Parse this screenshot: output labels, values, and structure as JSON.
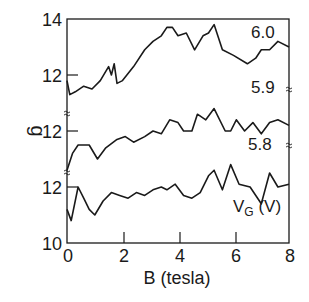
{
  "chart_data": {
    "type": "line",
    "title": "",
    "xlabel": "B (tesla)",
    "ylabel": "g",
    "xlim": [
      0,
      8
    ],
    "ylim": [
      10,
      14
    ],
    "x_ticks": [
      "0",
      "2",
      "4",
      "6",
      "8"
    ],
    "y_ticks": [
      "10",
      "12",
      "12",
      "12",
      "14"
    ],
    "grid": false,
    "legend": {
      "title": "V_G (V)",
      "position": "right, inline labels"
    },
    "series": [
      {
        "name": "6.0",
        "x": [
          0.0,
          0.1,
          0.3,
          0.6,
          0.9,
          1.2,
          1.5,
          1.6,
          1.7,
          1.8,
          2.0,
          2.4,
          2.8,
          3.1,
          3.4,
          3.6,
          3.8,
          4.0,
          4.3,
          4.6,
          4.9,
          5.1,
          5.3,
          5.6,
          6.0,
          6.5,
          6.8,
          7.0,
          7.3,
          7.6,
          8.0
        ],
        "values": [
          11.8,
          11.3,
          11.4,
          11.6,
          11.5,
          11.8,
          12.3,
          12.0,
          12.4,
          11.7,
          11.8,
          12.3,
          12.9,
          13.2,
          13.4,
          13.7,
          13.7,
          13.4,
          13.5,
          12.9,
          13.4,
          13.5,
          13.8,
          12.9,
          12.7,
          12.4,
          12.6,
          12.9,
          12.9,
          13.2,
          13.0
        ]
      },
      {
        "name": "5.9",
        "x": [
          0.0,
          0.2,
          0.4,
          0.8,
          1.1,
          1.4,
          1.8,
          2.1,
          2.4,
          2.8,
          3.1,
          3.4,
          3.7,
          4.0,
          4.2,
          4.5,
          4.7,
          5.0,
          5.3,
          5.7,
          5.9,
          6.1,
          6.4,
          6.7,
          7.0,
          7.3,
          7.6,
          8.0
        ],
        "values": [
          10.6,
          11.2,
          11.5,
          11.5,
          11.0,
          11.4,
          11.7,
          11.8,
          11.6,
          11.8,
          12.0,
          11.9,
          12.4,
          12.3,
          12.0,
          12.0,
          12.6,
          12.4,
          12.8,
          12.0,
          12.0,
          12.4,
          12.0,
          12.3,
          11.9,
          12.3,
          12.4,
          12.2
        ]
      },
      {
        "name": "5.8",
        "x": [
          0.0,
          0.15,
          0.4,
          0.6,
          0.8,
          1.0,
          1.3,
          1.6,
          1.9,
          2.2,
          2.5,
          2.8,
          3.1,
          3.4,
          3.6,
          3.9,
          4.2,
          4.5,
          4.8,
          5.1,
          5.3,
          5.6,
          5.9,
          6.2,
          6.6,
          7.0,
          7.3,
          7.6,
          8.0
        ],
        "values": [
          11.2,
          10.8,
          12.0,
          11.6,
          11.2,
          11.0,
          11.5,
          11.8,
          11.7,
          11.6,
          11.8,
          11.7,
          11.9,
          12.0,
          11.9,
          12.1,
          11.7,
          11.6,
          11.8,
          12.4,
          12.6,
          11.9,
          12.8,
          12.1,
          12.0,
          11.4,
          12.5,
          12.0,
          12.1
        ]
      }
    ]
  },
  "labels": {
    "y_14": "14",
    "y_12_top": "12",
    "y_12_mid": "12",
    "y_12_bot": "12",
    "y_10": "10",
    "x_0": "0",
    "x_2": "2",
    "x_4": "4",
    "x_6": "6",
    "x_8": "8",
    "xlabel": "B (tesla)",
    "ylabel": "g",
    "series_6_0": "6.0",
    "series_5_9": "5.9",
    "series_5_8": "5.8",
    "legend_v": "V",
    "legend_g": "G",
    "legend_unit": " (V)"
  }
}
